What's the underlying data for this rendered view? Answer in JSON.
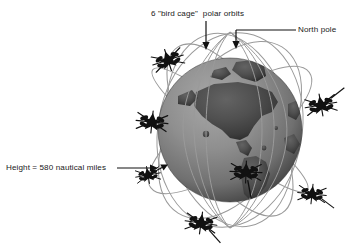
{
  "figure": {
    "background_color": "#ffffff",
    "width": 353,
    "height": 251
  },
  "labels": {
    "birdcage": "6 \"bird cage\"  polar orbits",
    "north_pole": "North pole",
    "height": "Height = 580 nautical miles"
  },
  "annotations": {
    "birdcage_arrow": "arrow-down-icon",
    "northpole_arrow": "arrow-down-icon",
    "height_arrow": "arrow-right-icon",
    "height_gap_marker": "double-arrow-icon"
  },
  "globe": {
    "name": "earth-globe",
    "center_x": 230,
    "center_y": 130,
    "radius": 72,
    "ocean_color": "#8c8c8c",
    "land_color": "#4f4f4f",
    "shadow_color": "#343434",
    "highlight_color": "#ababab",
    "continents_shown": "Americas"
  },
  "orbits": {
    "count": 6,
    "type": "polar",
    "stroke_color": "#9a9a9a",
    "stroke_width": 1,
    "description": "6 bird cage polar orbits converging at the north pole"
  },
  "satellites": {
    "count": 7,
    "color": "#111111",
    "items": [
      {
        "name": "satellite-upper-left",
        "x": 168,
        "y": 60,
        "rot": -18,
        "scale": 1.0
      },
      {
        "name": "satellite-left",
        "x": 152,
        "y": 122,
        "rot": 6,
        "scale": 1.0
      },
      {
        "name": "satellite-lower-left",
        "x": 148,
        "y": 175,
        "rot": -10,
        "scale": 0.78
      },
      {
        "name": "satellite-bottom",
        "x": 201,
        "y": 223,
        "rot": 8,
        "scale": 1.0
      },
      {
        "name": "satellite-center",
        "x": 246,
        "y": 172,
        "rot": 2,
        "scale": 1.0
      },
      {
        "name": "satellite-right",
        "x": 321,
        "y": 105,
        "rot": -10,
        "scale": 1.0
      },
      {
        "name": "satellite-lower-right",
        "x": 312,
        "y": 194,
        "rot": 6,
        "scale": 0.9
      }
    ]
  }
}
